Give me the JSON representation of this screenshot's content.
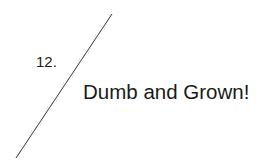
{
  "item": {
    "number": "12.",
    "title": "Dumb and Grown!"
  },
  "divider": {
    "color": "#333333"
  }
}
